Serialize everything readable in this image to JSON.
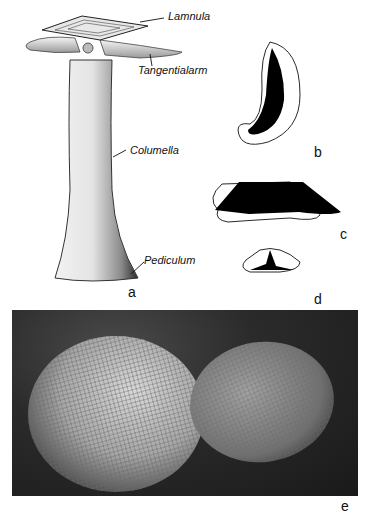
{
  "figure": {
    "panels": [
      {
        "id": "a",
        "letter": "a",
        "description": "Drawing of sclerite in lateral view"
      },
      {
        "id": "b",
        "letter": "b",
        "description": "Cross-section, curved"
      },
      {
        "id": "c",
        "letter": "c",
        "description": "Cross-section, trapezoidal"
      },
      {
        "id": "d",
        "letter": "d",
        "description": "Cross-section, small triangular"
      },
      {
        "id": "e",
        "letter": "e",
        "description": "Photograph of two fossil plates with reticulate surface"
      }
    ],
    "labels": {
      "lamnula": "Lamnula",
      "tangentialarm": "Tangentialarm",
      "columella": "Columella",
      "pediculum": "Pediculum"
    },
    "colors": {
      "ink": "#111111",
      "paper": "#ffffff",
      "photo_dark": "#1a1a1a",
      "photo_light": "#d8d8d8"
    }
  }
}
